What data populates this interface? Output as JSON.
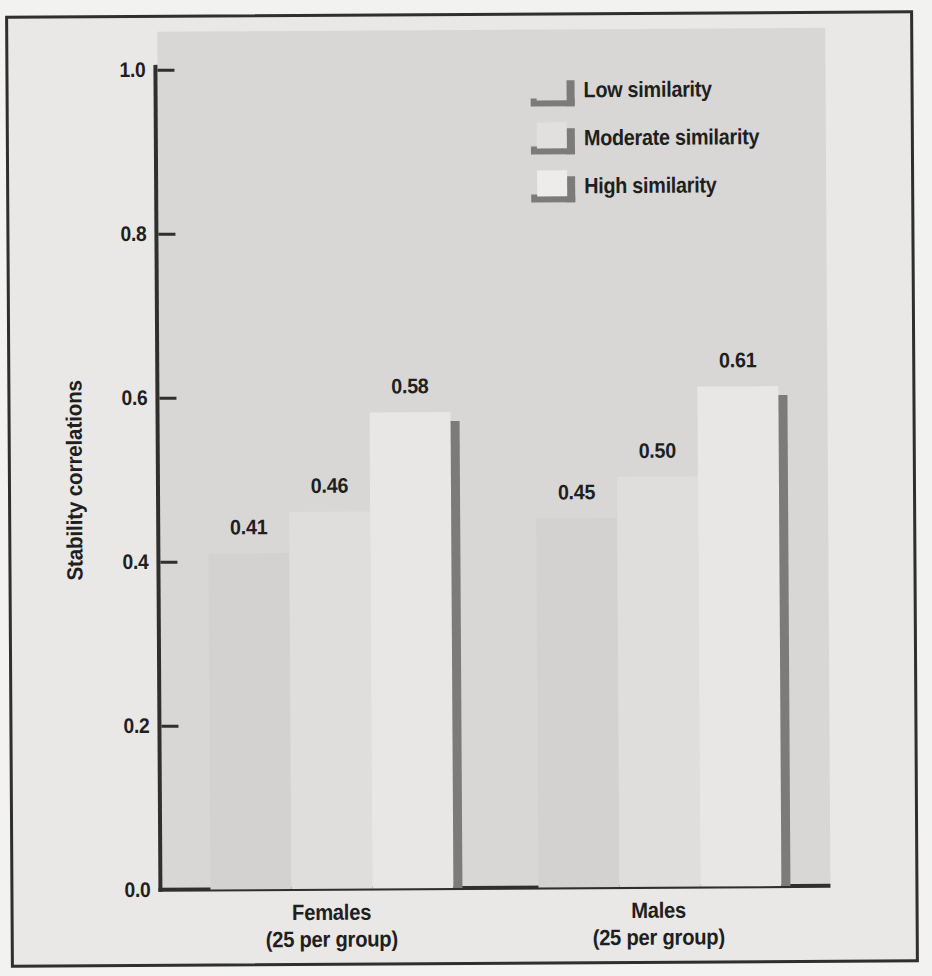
{
  "chart_data": {
    "type": "bar",
    "title": "",
    "ylabel": "Stability correlations",
    "ylim": [
      0,
      1.0
    ],
    "yticks": [
      "1.0",
      "0.8",
      "0.6",
      "0.4",
      "0.2",
      "0.0"
    ],
    "grid": false,
    "legend_position": "top-right",
    "groups": [
      {
        "label": "Females",
        "sublabel": "(25 per group)"
      },
      {
        "label": "Males",
        "sublabel": "(25 per group)"
      }
    ],
    "series": [
      {
        "name": "Low similarity",
        "values": [
          0.41,
          0.45
        ]
      },
      {
        "name": "Moderate similarity",
        "values": [
          0.46,
          0.5
        ]
      },
      {
        "name": "High similarity",
        "values": [
          0.58,
          0.61
        ]
      }
    ],
    "value_labels": [
      [
        "0.41",
        "0.46",
        "0.58"
      ],
      [
        "0.45",
        "0.50",
        "0.61"
      ]
    ]
  },
  "colors": {
    "page": "#f2f2f0",
    "paper": "#e9e8e6",
    "plot-bg": "#d8d7d5",
    "bar-low": "#d3d2d0",
    "bar-moderate": "#dfdedc",
    "bar-high": "#e8e7e5",
    "bar-shadow": "#7b7b7b",
    "line": "#2f2f2d",
    "text": "#1f1f1f"
  }
}
